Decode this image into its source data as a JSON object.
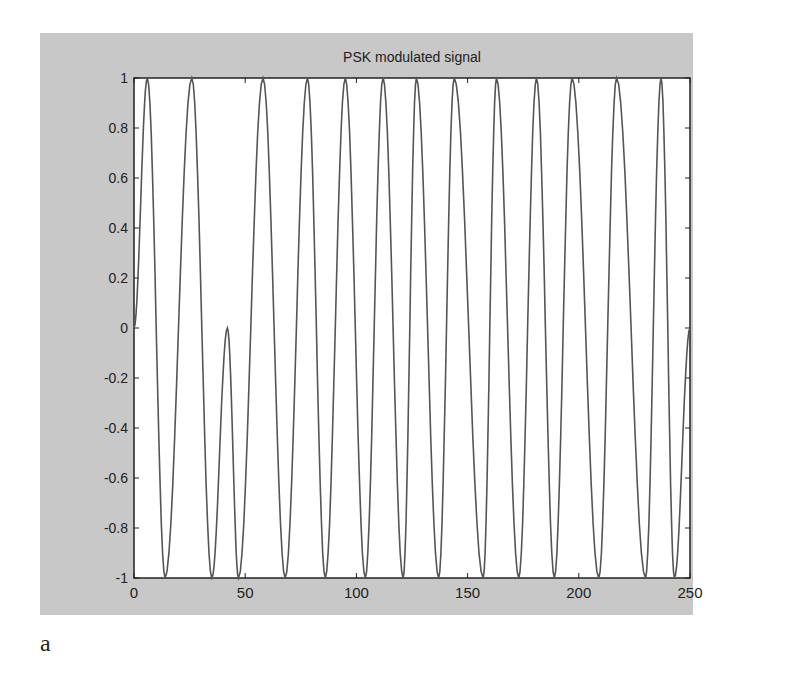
{
  "figure": {
    "caption": "a",
    "background_color": "#c8c8c8",
    "plot_background": "#ffffff",
    "line_color": "#555555"
  },
  "chart_data": {
    "type": "line",
    "title": "PSK modulated signal",
    "xlabel": "",
    "ylabel": "",
    "xlim": [
      0,
      250
    ],
    "ylim": [
      -1,
      1
    ],
    "grid": false,
    "legend": null,
    "x_ticks": [
      0,
      50,
      100,
      150,
      200,
      250
    ],
    "x_tick_labels": [
      "0",
      "50",
      "100",
      "150",
      "200",
      "250"
    ],
    "y_ticks": [
      1,
      0.8,
      0.6,
      0.4,
      0.2,
      0,
      -0.2,
      -0.4,
      -0.6,
      -0.8,
      -1
    ],
    "y_tick_labels": [
      "1",
      "0.8",
      "0.6",
      "0.4",
      "0.2",
      "0",
      "-0.2",
      "-0.4",
      "-0.6",
      "-0.8",
      "-1"
    ],
    "series": [
      {
        "name": "PSK signal",
        "x": [
          0,
          6,
          14,
          26,
          35,
          42,
          47,
          58,
          68,
          78,
          86,
          95,
          104,
          112,
          121,
          127,
          137,
          144,
          157,
          163,
          173,
          181,
          189,
          197,
          209,
          217,
          230,
          237,
          243,
          250
        ],
        "y": [
          0,
          1,
          -1,
          1,
          -1,
          0,
          -1,
          1,
          -1,
          1,
          -1,
          1,
          -1,
          1,
          -1,
          1,
          -1,
          1,
          -1,
          1,
          -1,
          1,
          -1,
          1,
          -1,
          1,
          -1,
          1,
          -1,
          0
        ]
      }
    ]
  }
}
